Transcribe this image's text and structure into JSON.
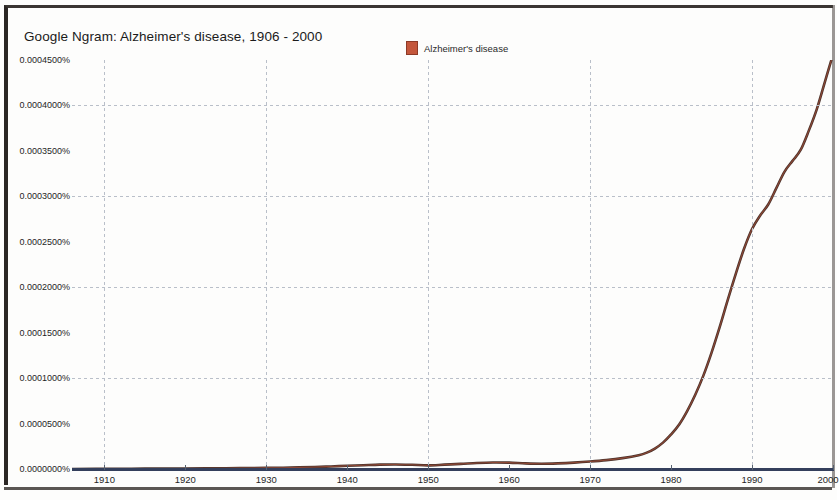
{
  "chart_data": {
    "type": "line",
    "title": "Google Ngram: Alzheimer's disease, 1906 - 2000",
    "xlabel": "",
    "ylabel": "",
    "grid": true,
    "legend_position": "top-center",
    "xlim": [
      1906,
      2000
    ],
    "ylim": [
      0.0,
      0.00045
    ],
    "xticks": [
      "1910",
      "1920",
      "1930",
      "1940",
      "1950",
      "1960",
      "1970",
      "1980",
      "1990",
      "2000"
    ],
    "xtick_values": [
      1910,
      1920,
      1930,
      1940,
      1950,
      1960,
      1970,
      1980,
      1990,
      2000
    ],
    "yticks": [
      "0.0004500%",
      "0.0004000%",
      "0.0003500%",
      "0.0003000%",
      "0.0002500%",
      "0.0002000%",
      "0.0001500%",
      "0.0001000%",
      "0.0000500%",
      "0.0000000%"
    ],
    "ytick_values": [
      0.00045,
      0.0004,
      0.00035,
      0.0003,
      0.00025,
      0.0002,
      0.00015,
      0.0001,
      5e-05,
      0.0
    ],
    "y_unit": "%",
    "gridline_y_values": [
      0.0004,
      0.0003,
      0.0002,
      0.0001
    ],
    "gridline_x_values": [
      1910,
      1930,
      1950,
      1970,
      1990
    ],
    "series": [
      {
        "name": "Alzheimer's disease",
        "color": "#4a332c",
        "marker_color": "#c4573c",
        "x": [
          1906,
          1910,
          1915,
          1920,
          1925,
          1930,
          1933,
          1936,
          1938,
          1940,
          1942,
          1944,
          1946,
          1948,
          1950,
          1952,
          1954,
          1956,
          1958,
          1960,
          1962,
          1964,
          1966,
          1968,
          1970,
          1972,
          1974,
          1976,
          1977,
          1978,
          1979,
          1980,
          1981,
          1982,
          1983,
          1984,
          1985,
          1986,
          1987,
          1988,
          1989,
          1990,
          1991,
          1992,
          1993,
          1994,
          1995,
          1996,
          1997,
          1998,
          1999,
          2000
        ],
        "values": [
          0.0,
          2e-07,
          4e-07,
          6e-07,
          9e-07,
          1.2e-06,
          1.6e-06,
          2.2e-06,
          2.8e-06,
          3.6e-06,
          4.2e-06,
          4.8e-06,
          5e-06,
          4.6e-06,
          4e-06,
          4.8e-06,
          5.6e-06,
          6.6e-06,
          7.2e-06,
          7e-06,
          6.2e-06,
          5.8e-06,
          6.2e-06,
          7e-06,
          8.2e-06,
          9.8e-06,
          1.2e-05,
          1.52e-05,
          1.8e-05,
          2.25e-05,
          2.9e-05,
          3.8e-05,
          4.9e-05,
          6.4e-05,
          8.2e-05,
          0.000103,
          0.000128,
          0.000156,
          0.000186,
          0.000215,
          0.000242,
          0.000264,
          0.000279,
          0.000291,
          0.000309,
          0.000327,
          0.000339,
          0.000351,
          0.000372,
          0.000396,
          0.000426,
          0.000456
        ]
      }
    ]
  },
  "legend": {
    "entries": [
      {
        "label": "Alzheimer's disease",
        "swatch_color": "#c4573c"
      }
    ]
  }
}
